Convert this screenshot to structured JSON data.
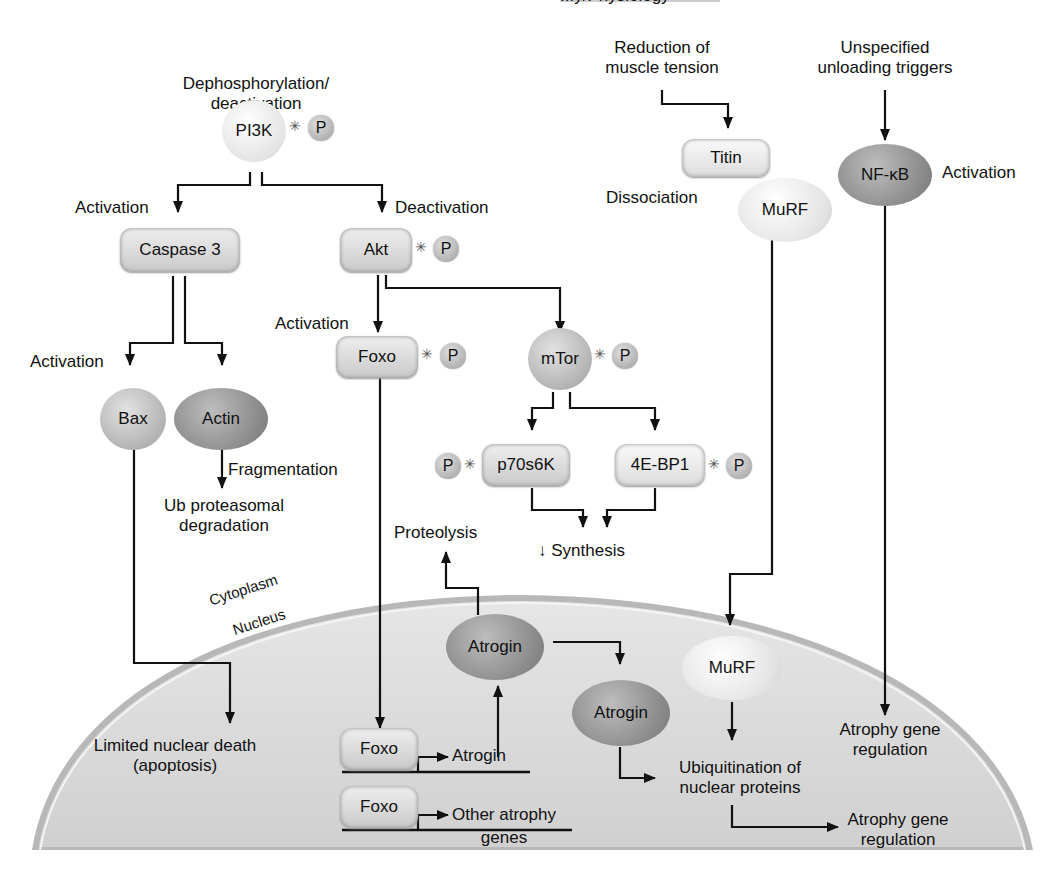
{
  "header": {
    "running_title_fragment": "...y/Physiology"
  },
  "compartments": {
    "cytoplasm": "Cytoplasm",
    "nucleus": "Nucleus"
  },
  "triggers": {
    "pi3k_trigger": "Dephosphorylation/\ndeactivation",
    "tension": "Reduction of\nmuscle tension",
    "unloading": "Unspecified\nunloading triggers"
  },
  "nodes": {
    "pi3k": "PI3K",
    "caspase3": "Caspase 3",
    "akt": "Akt",
    "foxo": "Foxo",
    "mtor": "mTor",
    "bax": "Bax",
    "actin": "Actin",
    "p70s6k": "p70s6K",
    "eb4p1": "4E-BP1",
    "titin": "Titin",
    "murf": "MuRF",
    "nfkb": "NF-κB",
    "atrogin1": "Atrogin",
    "atrogin2": "Atrogin",
    "murf_nuc": "MuRF",
    "foxo_gene1": "Foxo",
    "foxo_gene2": "Foxo",
    "phospho": "P"
  },
  "edge_labels": {
    "act_caspase": "Activation",
    "deact_akt": "Deactivation",
    "act_foxo": "Activation",
    "act_bax": "Activation",
    "fragmentation": "Fragmentation",
    "dissociation": "Dissociation",
    "act_nfkb": "Activation"
  },
  "outcomes": {
    "ub_degradation": "Ub proteasomal\ndegradation",
    "proteolysis": "Proteolysis",
    "synthesis": "↓ Synthesis",
    "nuclear_death": "Limited nuclear death\n(apoptosis)",
    "atrogin_gene": "Atrogin",
    "other_genes": "Other atrophy\ngenes",
    "ubiquitination": "Ubiquitination of\nnuclear proteins",
    "atrophy_reg1": "Atrophy gene\nregulation",
    "atrophy_reg2": "Atrophy gene\nregulation"
  }
}
